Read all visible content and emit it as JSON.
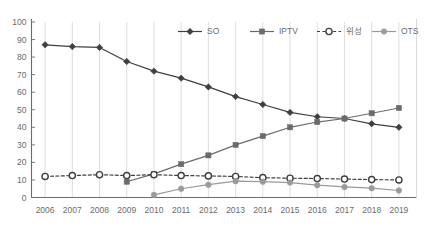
{
  "chart_data": {
    "type": "line",
    "title": "",
    "subtitle": "",
    "xlabel": "",
    "ylabel": "",
    "categories": [
      "2006",
      "2007",
      "2008",
      "2009",
      "2010",
      "2011",
      "2012",
      "2013",
      "2014",
      "2015",
      "2016",
      "2017",
      "2018",
      "2019"
    ],
    "ylim": [
      0,
      100
    ],
    "yticks": [
      "0",
      "10",
      "20",
      "30",
      "40",
      "50",
      "60",
      "70",
      "80",
      "90",
      "100"
    ],
    "ytick_values": [
      0,
      10,
      20,
      30,
      40,
      50,
      60,
      70,
      80,
      90,
      100
    ],
    "grid": "vertical-only",
    "legend_position": "top-center",
    "series": [
      {
        "name": "SO",
        "color": "#3f3f3f",
        "marker": "diamond",
        "line_style": "solid",
        "values": [
          87,
          86,
          85.5,
          77.5,
          72,
          68,
          63,
          57.5,
          53,
          48.5,
          46,
          45,
          42,
          40
        ]
      },
      {
        "name": "IPTV",
        "color": "#6b6b6b",
        "marker": "square",
        "line_style": "solid",
        "values": [
          null,
          null,
          null,
          9,
          13.5,
          19,
          24,
          30,
          35,
          40,
          43,
          45,
          48,
          51
        ]
      },
      {
        "name": "위성",
        "color": "#3f3f3f",
        "marker": "circle-open",
        "line_style": "dashed",
        "values": [
          12,
          12.5,
          13,
          12.5,
          13,
          12.5,
          12.3,
          12,
          11.3,
          11,
          10.8,
          10.5,
          10.2,
          10
        ]
      },
      {
        "name": "OTS",
        "color": "#9a9a9a",
        "marker": "circle",
        "line_style": "solid",
        "values": [
          null,
          null,
          null,
          null,
          1.5,
          5,
          7.3,
          9.3,
          9,
          8.5,
          7,
          6,
          5.3,
          4
        ]
      }
    ]
  },
  "colors": {
    "axis": "#6b6b6b",
    "gridline": "#d6d6d6",
    "background": "#ffffff",
    "so": "#3f3f3f",
    "iptv": "#6b6b6b",
    "satellite": "#3f3f3f",
    "ots": "#9a9a9a"
  }
}
